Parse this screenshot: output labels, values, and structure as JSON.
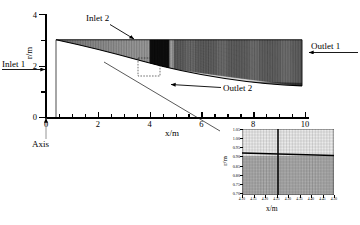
{
  "figure": {
    "type": "computational-mesh-diagram"
  },
  "main_axes": {
    "xlabel": "x/m",
    "ylabel": "r/m",
    "xticks": [
      0,
      2,
      4,
      6,
      8,
      10
    ],
    "xtick_labels": [
      "0",
      "2",
      "4",
      "6",
      "8",
      "10"
    ],
    "yticks": [
      0,
      2,
      4
    ],
    "ytick_labels": [
      "0",
      "2",
      "4"
    ],
    "xlim": [
      -0.4,
      10.4
    ],
    "ylim": [
      0,
      4
    ]
  },
  "annotations": {
    "inlet2": "Inlet 2",
    "inlet1": "Inlet 1",
    "outlet1": "Outlet 1",
    "outlet2": "Outlet 2",
    "axis": "Axis"
  },
  "inset": {
    "xlabel": "x/m",
    "ylabel": "r/m",
    "ytick_labels": [
      "1.05",
      "1.00",
      "0.95",
      "0.90",
      "0.85",
      "0.80",
      "0.75",
      "0.70"
    ],
    "xtick_labels": [
      "4.10",
      "4.15",
      "4.20",
      "4.25",
      "4.30",
      "4.35",
      "4.40",
      "4.45",
      "4.50"
    ],
    "xlim": [
      4.08,
      4.52
    ],
    "ylim": [
      0.68,
      1.06
    ]
  },
  "chart_data": {
    "type": "line",
    "title": "",
    "xlabel": "x/m",
    "ylabel": "r/m",
    "xlim": [
      -0.4,
      10.4
    ],
    "ylim": [
      0,
      4
    ],
    "grid": true,
    "legend": "none",
    "series": [
      {
        "name": "top-wall (Inlet 2 boundary)",
        "x": [
          0,
          2,
          4,
          6,
          8,
          10
        ],
        "values": [
          3.0,
          3.0,
          3.0,
          3.0,
          3.0,
          3.0
        ]
      },
      {
        "name": "interface-band (Outlet 2 / shear layer)",
        "x": [
          0,
          1,
          2,
          3,
          4,
          5,
          6,
          7,
          8,
          9,
          10
        ],
        "values": [
          1.45,
          1.45,
          1.45,
          1.45,
          1.45,
          1.45,
          1.45,
          1.45,
          1.45,
          1.45,
          1.45
        ]
      },
      {
        "name": "lower-wall (diverging contour)",
        "x": [
          0,
          1,
          2,
          3,
          4,
          5,
          6,
          7,
          8,
          9,
          10
        ],
        "values": [
          0.0,
          0.12,
          0.3,
          0.55,
          0.85,
          1.12,
          1.34,
          1.5,
          1.62,
          1.7,
          1.75
        ]
      }
    ],
    "annotations": [
      {
        "text": "Inlet 2",
        "x": 2.6,
        "y": 3.9,
        "arrow_to": {
          "x": 4.0,
          "y": 3.05
        }
      },
      {
        "text": "Inlet 1",
        "x": -1.2,
        "y": 1.45,
        "arrow_to": {
          "x": 0.0,
          "y": 1.45
        }
      },
      {
        "text": "Outlet 1",
        "x": 10.8,
        "y": 2.4,
        "arrow_to": {
          "x": 10.0,
          "y": 2.4
        }
      },
      {
        "text": "Outlet 2",
        "x": 7.0,
        "y": 0.9,
        "arrow_to": {
          "x": 4.35,
          "y": 1.2
        }
      },
      {
        "text": "Axis",
        "x": 0.0,
        "y": -0.9,
        "arrow_to": {
          "x": 0.0,
          "y": 0.0
        }
      }
    ],
    "inset_region": {
      "x": [
        4.08,
        4.52
      ],
      "y": [
        0.68,
        1.06
      ]
    }
  }
}
